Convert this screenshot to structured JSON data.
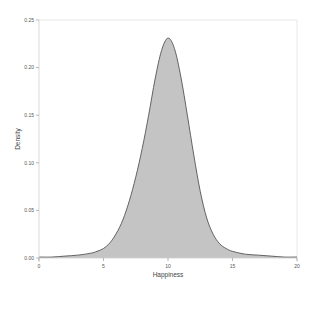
{
  "chart_data": {
    "type": "area",
    "title": "",
    "xlabel": "Happiness",
    "ylabel": "Density",
    "xlim": [
      0,
      20
    ],
    "ylim": [
      0,
      0.25
    ],
    "x_ticks": [
      0,
      5,
      10,
      15,
      20
    ],
    "x_tick_labels": [
      "0",
      "5",
      "10",
      "15",
      "20"
    ],
    "y_ticks": [
      0.0,
      0.05,
      0.1,
      0.15,
      0.2,
      0.25
    ],
    "y_tick_labels": [
      "0.00",
      "0.05",
      "0.10",
      "0.15",
      "0.20",
      "0.25"
    ],
    "grid": false,
    "legend": null,
    "fill_color": "#c4c4c4",
    "line_color": "#555555",
    "series": [
      {
        "name": "Density",
        "x": [
          0,
          1,
          2,
          3,
          4,
          4.5,
          5,
          5.5,
          6,
          6.5,
          7,
          7.5,
          8,
          8.5,
          9,
          9.5,
          10,
          10.5,
          11,
          11.5,
          12,
          12.5,
          13,
          13.5,
          14,
          14.5,
          15,
          16,
          17,
          18,
          19,
          20
        ],
        "values": [
          0.001,
          0.001,
          0.002,
          0.003,
          0.005,
          0.007,
          0.01,
          0.016,
          0.026,
          0.04,
          0.06,
          0.085,
          0.115,
          0.15,
          0.188,
          0.218,
          0.231,
          0.22,
          0.19,
          0.15,
          0.108,
          0.07,
          0.042,
          0.025,
          0.015,
          0.01,
          0.007,
          0.004,
          0.003,
          0.002,
          0.001,
          0.001
        ]
      }
    ]
  }
}
